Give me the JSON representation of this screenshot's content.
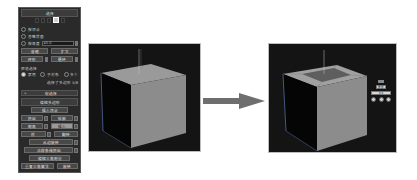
{
  "panel": {
    "selection": {
      "title": "选择",
      "subobject_mode_active": "polygon",
      "by_vertex": "按顶点",
      "ignore_backfacing": "忽略背面",
      "by_angle": "按角度",
      "by_angle_value": "45.0",
      "shrink": "收缩",
      "grow": "扩大",
      "ring": "环形",
      "loop": "循环",
      "preview_selection": "预览选择",
      "preview_options": [
        "禁用",
        "子对象",
        "多个"
      ],
      "preview_selected": "禁用",
      "status": "选择了多边形 5/8"
    },
    "soft_selection": {
      "title": "软选择"
    },
    "edit_polygons": {
      "title": "编辑多边形",
      "insert_vertex": "插入顶点",
      "extrude": "挤出",
      "outline": "轮廓",
      "bevel": "倒角",
      "inset": "插入",
      "bridge": "桥",
      "flip": "翻转",
      "hinge_from_edge": "从边旋转",
      "extrude_along_spline": "沿样条线挤出",
      "edit_triangulation": "编辑三角剖分",
      "retriangulate": "重复三角算法",
      "turn": "旋转"
    }
  },
  "viewports": {
    "before": {
      "object": "box",
      "colors": {
        "bg": "#141414",
        "top": "#9a9a9a",
        "front": "#8c8c8c",
        "side": "#050505"
      }
    },
    "after": {
      "object": "box-with-inset-top",
      "colors": {
        "bg": "#141414",
        "top": "#a0a0a0",
        "inset": "#5e5e5e",
        "front": "#8c8c8c",
        "side": "#050505"
      }
    }
  },
  "arrow": {
    "color": "#6e6e6e"
  },
  "caddy": {
    "value_label": "0.0",
    "mode_label": "按组"
  }
}
